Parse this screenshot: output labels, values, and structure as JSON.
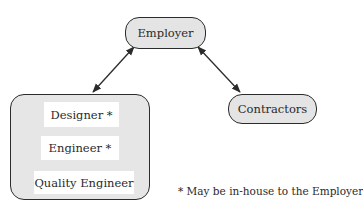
{
  "diagram": {
    "type": "organizational-relationship",
    "nodes": {
      "employer": {
        "label": "Employer"
      },
      "contractors": {
        "label": "Contractors"
      },
      "team": {
        "members": [
          {
            "label": "Designer *"
          },
          {
            "label": "Engineer *"
          },
          {
            "label": "Quality Engineer"
          }
        ]
      }
    },
    "edges": [
      {
        "from": "employer",
        "to": "team",
        "style": "bidirectional-arrow"
      },
      {
        "from": "employer",
        "to": "contractors",
        "style": "bidirectional-arrow"
      }
    ],
    "footnote": "* May be in-house to the Employer",
    "colors": {
      "node_fill": "#e4e4e4",
      "inner_fill": "#ffffff",
      "stroke": "#2b2b2b",
      "text": "#2a2a2a"
    }
  }
}
